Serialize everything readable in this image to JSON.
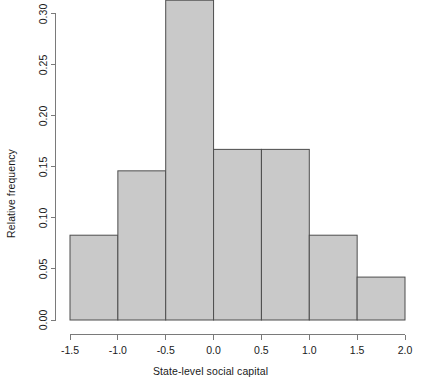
{
  "chart_data": {
    "type": "bar",
    "title": "",
    "subtitle": "",
    "xlabel": "State-level social capital",
    "ylabel": "Relative frequency",
    "categories": [
      "-1.5 to -1.0",
      "-1.0 to -0.5",
      "-0.5 to 0.0",
      "0.0 to 0.5",
      "0.5 to 1.0",
      "1.0 to 1.5",
      "1.5 to 2.0"
    ],
    "bin_edges": [
      -1.5,
      -1.0,
      -0.5,
      0.0,
      0.5,
      1.0,
      1.5,
      2.0
    ],
    "values": [
      0.083,
      0.146,
      0.313,
      0.167,
      0.167,
      0.083,
      0.042
    ],
    "xlim": [
      -1.5,
      2.0
    ],
    "ylim": [
      0.0,
      0.3125
    ],
    "xticks": [
      -1.5,
      -1.0,
      -0.5,
      0.0,
      0.5,
      1.0,
      1.5,
      2.0
    ],
    "xtick_labels": [
      "-1.5",
      "-1.0",
      "-0.5",
      "0.0",
      "0.5",
      "1.0",
      "1.5",
      "2.0"
    ],
    "yticks": [
      0.0,
      0.05,
      0.1,
      0.15,
      0.2,
      0.25,
      0.3
    ],
    "ytick_labels": [
      "0.00",
      "0.05",
      "0.10",
      "0.15",
      "0.20",
      "0.25",
      "0.30"
    ],
    "grid": false,
    "legend": false,
    "bar_fill": "#c9c9c9",
    "bar_stroke": "#4d4d4d",
    "axis_color": "#7a7a7a",
    "text_color": "#1a1a1a",
    "background": "#ffffff"
  }
}
